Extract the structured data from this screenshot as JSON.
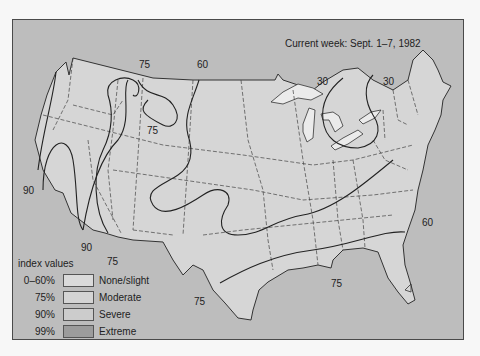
{
  "map": {
    "title": "Current week: Sept. 1–7, 1982",
    "colors": {
      "background": "#bdbdbd",
      "land_none_slight": "#d8d8d8",
      "land_moderate": "#d3d3d3",
      "land_severe": "#cfcfcf",
      "land_extreme": "#9a9a9a",
      "lakes": "#e6e6e6",
      "contour": "#222222",
      "border": "#444444"
    },
    "contour_labels": [
      {
        "text": "75",
        "x": 126,
        "y": 39
      },
      {
        "text": "60",
        "x": 184,
        "y": 39
      },
      {
        "text": "30",
        "x": 364,
        "y": 56
      },
      {
        "text": "30",
        "x": 420,
        "y": 56
      },
      {
        "text": "75",
        "x": 134,
        "y": 105
      },
      {
        "text": "90",
        "x": 13,
        "y": 166
      },
      {
        "text": "90",
        "x": 69,
        "y": 224
      },
      {
        "text": "75",
        "x": 95,
        "y": 238
      },
      {
        "text": "60",
        "x": 421,
        "y": 196
      },
      {
        "text": "75",
        "x": 330,
        "y": 258
      },
      {
        "text": "75",
        "x": 180,
        "y": 276
      }
    ]
  },
  "legend": {
    "title": "index values",
    "items": [
      {
        "pct": "0–60%",
        "label": "None/slight",
        "color": "#dadada"
      },
      {
        "pct": "75%",
        "label": "Moderate",
        "color": "#d4d4d4"
      },
      {
        "pct": "90%",
        "label": "Severe",
        "color": "#cccccc"
      },
      {
        "pct": "99%",
        "label": "Extreme",
        "color": "#9c9c9c"
      }
    ]
  }
}
